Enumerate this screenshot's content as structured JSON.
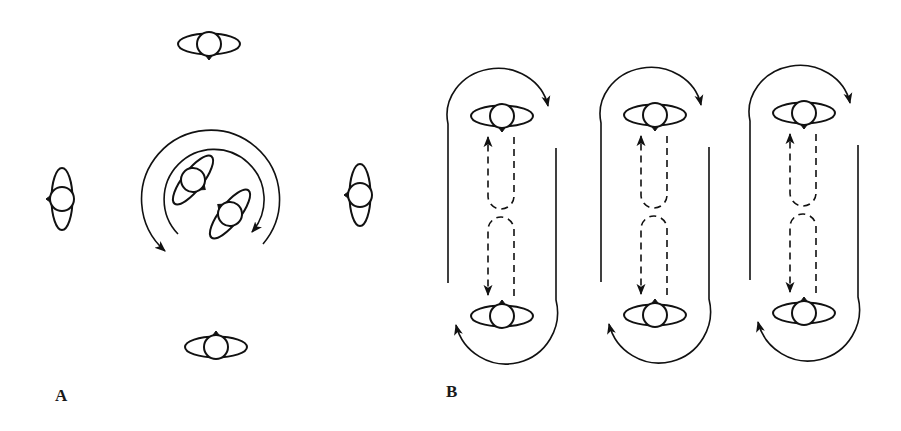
{
  "figure": {
    "panels": [
      {
        "id": "A",
        "label": "A",
        "description": "Four oriented figures around a central pair rotating inside concentric circular arrows",
        "figures": [
          {
            "position": "top",
            "orientation": "horizontal",
            "nose": "down"
          },
          {
            "position": "left",
            "orientation": "vertical",
            "nose": "left"
          },
          {
            "position": "right",
            "orientation": "vertical",
            "nose": "left"
          },
          {
            "position": "bottom",
            "orientation": "horizontal",
            "nose": "up"
          },
          {
            "position": "center-upper-left",
            "orientation": "tilted",
            "nose": "down-right"
          },
          {
            "position": "center-lower-right",
            "orientation": "tilted",
            "nose": "up-left"
          }
        ],
        "arrows": [
          {
            "type": "outer-arc",
            "direction": "counter-clockwise end at lower-left"
          },
          {
            "type": "inner-arc",
            "direction": "clockwise end at lower-right"
          }
        ]
      },
      {
        "id": "B",
        "label": "B",
        "description": "Three racetrack loops, each with facing figures at top and bottom, dashed reciprocating paths and circulating arrows",
        "columns": 3,
        "figures_per_column": [
          {
            "position": "top",
            "orientation": "horizontal",
            "nose": "down"
          },
          {
            "position": "bottom",
            "orientation": "horizontal",
            "nose": "up"
          }
        ],
        "arrows": [
          {
            "type": "top-arc",
            "direction": "clockwise toward right"
          },
          {
            "type": "bottom-arc",
            "direction": "clockwise toward left"
          },
          {
            "type": "dashed-up",
            "direction": "up"
          },
          {
            "type": "dashed-down",
            "direction": "down"
          }
        ]
      }
    ],
    "colors": {
      "stroke": "#111111",
      "background": "#ffffff"
    }
  }
}
